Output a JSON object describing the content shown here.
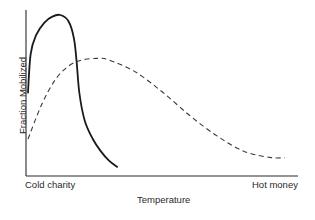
{
  "chart_data": {
    "type": "line",
    "title": "",
    "xlabel": "Temperature",
    "ylabel": "Fraction Mobilized",
    "x_tick_labels": {
      "left": "Cold charity",
      "right": "Hot money"
    },
    "grid": false,
    "legend": null,
    "axis_ranges": {
      "x": [
        0,
        1
      ],
      "y": [
        0,
        1
      ]
    },
    "series": [
      {
        "name": "solid curve",
        "style": "solid",
        "color": "#1a1a1a",
        "x": [
          0.0,
          0.01,
          0.03,
          0.06,
          0.09,
          0.12,
          0.15,
          0.17,
          0.18,
          0.19,
          0.21,
          0.24,
          0.27,
          0.3,
          0.33
        ],
        "y": [
          0.5,
          0.75,
          0.87,
          0.95,
          0.99,
          1.0,
          0.96,
          0.85,
          0.7,
          0.5,
          0.32,
          0.2,
          0.12,
          0.06,
          0.02
        ]
      },
      {
        "name": "dashed curve",
        "style": "dashed",
        "color": "#3a3a3a",
        "x": [
          0.0,
          0.05,
          0.1,
          0.15,
          0.2,
          0.26,
          0.3,
          0.4,
          0.5,
          0.6,
          0.7,
          0.8,
          0.9,
          0.95
        ],
        "y": [
          0.2,
          0.42,
          0.58,
          0.67,
          0.71,
          0.72,
          0.71,
          0.63,
          0.5,
          0.35,
          0.22,
          0.12,
          0.08,
          0.08
        ]
      }
    ]
  },
  "labels": {
    "ylabel": "Fraction Mobilized",
    "xlabel": "Temperature",
    "x_left": "Cold charity",
    "x_right": "Hot money"
  }
}
